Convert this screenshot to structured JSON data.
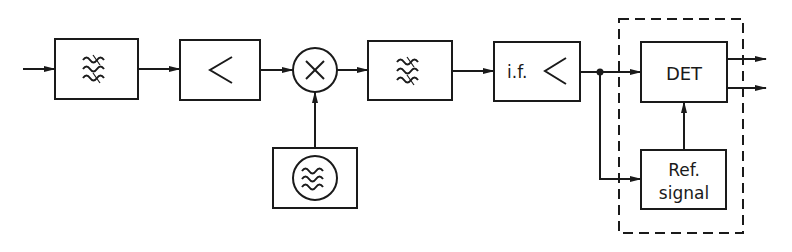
{
  "diagram": {
    "type": "block-diagram",
    "blocks": [
      {
        "id": "input-filter",
        "symbol": "bandpass-filter-icon",
        "label": ""
      },
      {
        "id": "rf-amplifier",
        "symbol": "amplifier-icon",
        "label": ""
      },
      {
        "id": "mixer",
        "symbol": "multiplier-icon",
        "label": "×"
      },
      {
        "id": "if-filter",
        "symbol": "bandpass-filter-icon",
        "label": ""
      },
      {
        "id": "if-amplifier",
        "symbol": "amplifier-icon",
        "label": "i.f."
      },
      {
        "id": "local-oscillator",
        "symbol": "oscillator-icon",
        "label": ""
      },
      {
        "id": "detector",
        "symbol": "",
        "label": "DET"
      },
      {
        "id": "reference-signal",
        "symbol": "",
        "label_line1": "Ref.",
        "label_line2": "signal"
      }
    ],
    "labels": {
      "if_amp": "i.f.",
      "det": "DET",
      "ref_line1": "Ref.",
      "ref_line2": "signal"
    },
    "edges": [
      {
        "from": "input",
        "to": "input-filter"
      },
      {
        "from": "input-filter",
        "to": "rf-amplifier"
      },
      {
        "from": "rf-amplifier",
        "to": "mixer"
      },
      {
        "from": "local-oscillator",
        "to": "mixer"
      },
      {
        "from": "mixer",
        "to": "if-filter"
      },
      {
        "from": "if-filter",
        "to": "if-amplifier"
      },
      {
        "from": "if-amplifier",
        "to": "detector"
      },
      {
        "from": "if-amplifier",
        "to": "reference-signal"
      },
      {
        "from": "reference-signal",
        "to": "detector"
      },
      {
        "from": "detector",
        "to": "output-1"
      },
      {
        "from": "detector",
        "to": "output-2"
      }
    ],
    "groups": [
      {
        "id": "synchronous-detector-group",
        "style": "dashed",
        "contains": [
          "detector",
          "reference-signal"
        ]
      }
    ],
    "colors": {
      "line": "#1a1a1a",
      "background": "#ffffff"
    }
  }
}
